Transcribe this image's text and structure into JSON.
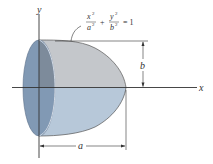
{
  "diagram": {
    "axes": {
      "x_label": "x",
      "y_label": "y"
    },
    "equation": {
      "term1_num": "x",
      "term1_num_exp": "2",
      "term1_den": "a",
      "term1_den_exp": "2",
      "plus": "+",
      "term2_num": "y",
      "term2_num_exp": "2",
      "term2_den": "b",
      "term2_den_exp": "2",
      "equals": "= 1"
    },
    "dimensions": {
      "height_label": "b",
      "length_label": "a"
    },
    "colors": {
      "upper_surface": "#c4c7cb",
      "lower_surface": "#b7c8d9",
      "front_face": "#8199b4",
      "front_face_dark": "#6d819b",
      "lines": "#333333"
    }
  }
}
